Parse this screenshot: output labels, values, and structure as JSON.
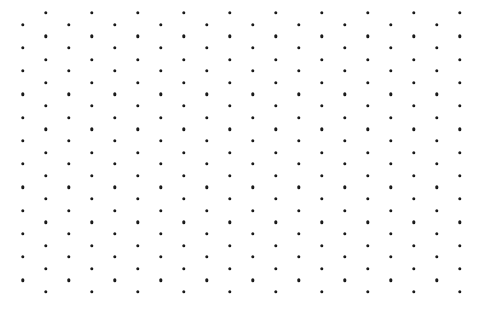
{
  "canvas": {
    "width": 491,
    "height": 320,
    "background_color": "#ffffff",
    "description": "staggered dot grid pattern"
  },
  "pattern": {
    "type": "staggered-dot-grid",
    "dot_color": "#1a1a1a",
    "dot_diameter": 3.4,
    "column_spacing": 46,
    "row_spacing": 23.25,
    "column_count": 20,
    "even_column_first_x": 46,
    "odd_column_first_x": 23,
    "even_column_first_y": 13,
    "odd_column_first_y": 24.6,
    "even_column_dot_count": 13,
    "odd_column_dot_count": 12,
    "total_dots": 250
  }
}
